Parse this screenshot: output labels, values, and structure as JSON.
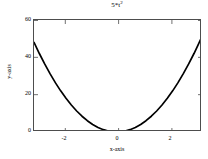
{
  "figure": {
    "background_color": "#ffffff",
    "axes_color": "#4d4d4d",
    "line_color": "#000000"
  },
  "chart_data": {
    "type": "line",
    "title": "5*t",
    "title_exponent": "2",
    "xlabel": "x-axis",
    "ylabel": "y-axis",
    "xlim": [
      -3.1,
      3.2
    ],
    "ylim": [
      0,
      60
    ],
    "xticks": [
      -2,
      0,
      2
    ],
    "xtick_labels": [
      "-2",
      "0",
      "2"
    ],
    "yticks": [
      0,
      20,
      40,
      60
    ],
    "ytick_labels": [
      "0",
      "20",
      "40",
      "60"
    ],
    "grid": false,
    "legend": null,
    "series": [
      {
        "name": "5*t^2",
        "x": [
          -3.1,
          -2.9,
          -2.7,
          -2.5,
          -2.3,
          -2.1,
          -1.9,
          -1.7,
          -1.5,
          -1.3,
          -1.1,
          -0.9,
          -0.7,
          -0.5,
          -0.3,
          -0.1,
          0.1,
          0.3,
          0.5,
          0.7,
          0.9,
          1.1,
          1.3,
          1.5,
          1.7,
          1.9,
          2.1,
          2.3,
          2.5,
          2.7,
          2.9,
          3.05,
          3.2
        ],
        "y": [
          48.05,
          42.05,
          36.45,
          31.25,
          26.45,
          22.05,
          18.05,
          14.45,
          11.25,
          8.45,
          6.05,
          4.05,
          2.45,
          1.25,
          0.45,
          0.05,
          0.05,
          0.45,
          1.25,
          2.45,
          4.05,
          6.05,
          8.45,
          11.25,
          14.45,
          18.05,
          22.05,
          26.45,
          31.25,
          36.45,
          42.05,
          46.51,
          51.2
        ]
      }
    ]
  }
}
